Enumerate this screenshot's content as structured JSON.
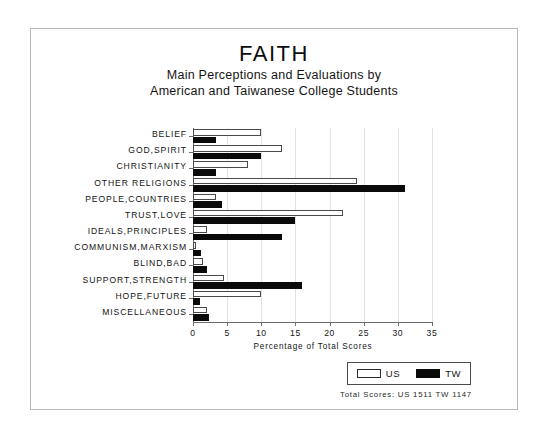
{
  "chart_data": {
    "type": "bar",
    "orientation": "horizontal",
    "title": "FAITH",
    "subtitle_line_1": "Main Perceptions and Evaluations by",
    "subtitle_line_2": "American and Taiwanese College Students",
    "xlabel": "Percentage of Total Scores",
    "ylabel": "",
    "xlim": [
      0,
      35
    ],
    "xticks": [
      0,
      5,
      10,
      15,
      20,
      25,
      30,
      35
    ],
    "grid": true,
    "legend_position": "bottom-right",
    "categories": [
      "BELIEF",
      "GOD,SPIRIT",
      "CHRISTIANITY",
      "OTHER RELIGIONS",
      "PEOPLE,COUNTRIES",
      "TRUST,LOVE",
      "IDEALS,PRINCIPLES",
      "COMMUNISM,MARXISM",
      "BLIND,BAD",
      "SUPPORT,STRENGTH",
      "HOPE,FUTURE",
      "MISCELLANEOUS"
    ],
    "series": [
      {
        "name": "US",
        "color": "#ffffff",
        "edge_color": "#4a4a4a",
        "values": [
          10.0,
          13.0,
          8.0,
          24.0,
          3.3,
          22.0,
          2.0,
          0.5,
          1.5,
          4.5,
          10.0,
          2.0
        ]
      },
      {
        "name": "TW",
        "color": "#0a0a0a",
        "edge_color": "#0a0a0a",
        "values": [
          3.3,
          10.0,
          3.3,
          31.0,
          4.3,
          15.0,
          13.0,
          1.2,
          2.0,
          16.0,
          1.0,
          2.3
        ]
      }
    ],
    "annotations": {
      "totals": "Total Scores:  US 1511  TW 1147"
    }
  },
  "legend": {
    "items": [
      {
        "label": "US"
      },
      {
        "label": "TW"
      }
    ]
  }
}
